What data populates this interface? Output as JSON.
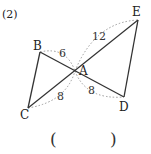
{
  "problem": {
    "number": "(2)"
  },
  "points": {
    "A": {
      "label": "A",
      "x": 75,
      "y": 71
    },
    "B": {
      "label": "B",
      "x": 40,
      "y": 52
    },
    "C": {
      "label": "C",
      "x": 28,
      "y": 108
    },
    "D": {
      "label": "D",
      "x": 124,
      "y": 97
    },
    "E": {
      "label": "E",
      "x": 138,
      "y": 20
    }
  },
  "segment_lengths": {
    "AE": "12",
    "AB": "6",
    "AC": "8",
    "AD": "8"
  },
  "answer_box": {
    "open": "(",
    "close": ")"
  },
  "colors": {
    "line": "#333333",
    "dotted": "#9a9a9a",
    "text": "#222222"
  }
}
